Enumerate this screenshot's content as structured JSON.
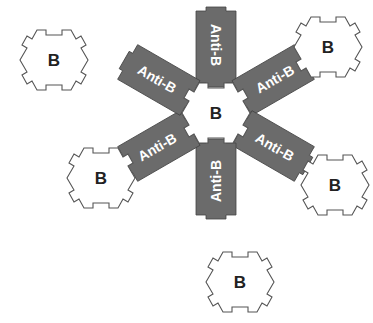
{
  "diagram": {
    "antigen_label": "B",
    "antibody_label": "Anti-B",
    "colors": {
      "antibody_fill": "#6b6b6b",
      "antigen_fill": "#ffffff",
      "outline": "#555555"
    },
    "center_antigen": {
      "label": "B"
    },
    "antibodies": [
      {
        "label": "Anti-B",
        "angle": -90
      },
      {
        "label": "Anti-B",
        "angle": -30
      },
      {
        "label": "Anti-B",
        "angle": 30
      },
      {
        "label": "Anti-B",
        "angle": 90
      },
      {
        "label": "Anti-B",
        "angle": 150
      },
      {
        "label": "Anti-B",
        "angle": 210
      }
    ],
    "outer_antigens": [
      {
        "label": "B",
        "position": "top-left-free"
      },
      {
        "label": "B",
        "position": "upper-right-bound"
      },
      {
        "label": "B",
        "position": "left-bound"
      },
      {
        "label": "B",
        "position": "right-bound"
      },
      {
        "label": "B",
        "position": "bottom-free"
      }
    ]
  }
}
